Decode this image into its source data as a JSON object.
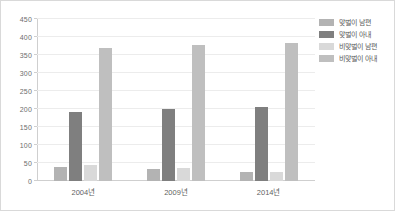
{
  "chart_data": {
    "type": "bar",
    "title": "",
    "xlabel": "",
    "ylabel": "",
    "categories": [
      "2004년",
      "2009년",
      "2014년"
    ],
    "ylim": [
      0,
      450
    ],
    "ytick_step": 50,
    "yticks": [
      "0",
      "50",
      "100",
      "150",
      "200",
      "250",
      "300",
      "350",
      "400",
      "450"
    ],
    "grid": true,
    "legend_position": "right",
    "series": [
      {
        "name": "맞벌이 남편",
        "color": "#b3b3b3",
        "values": [
          40,
          32,
          26
        ]
      },
      {
        "name": "맞벌이 아내",
        "color": "#7f7f7f",
        "values": [
          193,
          200,
          205
        ]
      },
      {
        "name": "비맞벌이 남편",
        "color": "#d9d9d9",
        "values": [
          45,
          35,
          25
        ]
      },
      {
        "name": "비맞벌이 아내",
        "color": "#bfbfbf",
        "values": [
          370,
          378,
          384
        ]
      }
    ]
  },
  "figure": {
    "background": "#ffffff",
    "border_color": "#d9d9d9",
    "gridline_color": "#ececec",
    "axis_color": "#cfcfcf",
    "tick_text_color": "#6d6d6d"
  }
}
